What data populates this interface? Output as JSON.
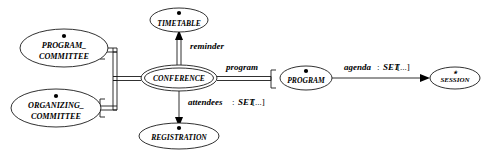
{
  "diagram": {
    "type": "entity-relationship",
    "background_color": "#ffffff",
    "line_color": "#1a1a1a",
    "text_color": "#000000",
    "nodes": [
      {
        "id": "program_committee",
        "label_line1": "PROGRAM_",
        "label_line2": "COMMITTEE",
        "marker": "filled-dot",
        "shape": "ellipse",
        "double_border": false,
        "cx": 64,
        "cy": 48,
        "rx": 44,
        "ry": 19
      },
      {
        "id": "organizing_committee",
        "label_line1": "ORGANIZING_",
        "label_line2": "COMMITTEE",
        "marker": "filled-dot",
        "shape": "ellipse",
        "double_border": false,
        "cx": 56,
        "cy": 108,
        "rx": 45,
        "ry": 19
      },
      {
        "id": "timetable",
        "label_line1": "TIMETABLE",
        "label_line2": "",
        "marker": "filled-dot",
        "shape": "ellipse",
        "double_border": false,
        "cx": 179,
        "cy": 20,
        "rx": 29,
        "ry": 12
      },
      {
        "id": "conference",
        "label_line1": "CONFERENCE",
        "label_line2": "",
        "marker": "none",
        "shape": "ellipse",
        "double_border": true,
        "cx": 179,
        "cy": 78,
        "rx": 38,
        "ry": 13
      },
      {
        "id": "registration",
        "label_line1": "REGISTRATION",
        "label_line2": "",
        "marker": "filled-dot",
        "shape": "ellipse",
        "double_border": false,
        "cx": 179,
        "cy": 136,
        "rx": 40,
        "ry": 13
      },
      {
        "id": "program",
        "label_line1": "PROGRAM",
        "label_line2": "",
        "marker": "filled-dot",
        "shape": "ellipse",
        "double_border": false,
        "cx": 306,
        "cy": 78,
        "rx": 26,
        "ry": 12
      },
      {
        "id": "session",
        "label_line1": "SESSION",
        "label_line2": "",
        "marker": "small-star",
        "shape": "ellipse",
        "double_border": false,
        "cx": 455,
        "cy": 78,
        "rx": 25,
        "ry": 11
      }
    ],
    "edges": [
      {
        "id": "reminder",
        "from": "conference",
        "to": "timetable",
        "attribute": "reminder",
        "type": "",
        "aggregation": "",
        "label": "reminder",
        "arrow": "up",
        "style": "double-line"
      },
      {
        "id": "attendees",
        "from": "conference",
        "to": "registration",
        "attribute": "attendees",
        "type": "SET",
        "aggregation": "[...]",
        "label": "attendees : SET [...]",
        "arrow": "down",
        "style": "single-line"
      },
      {
        "id": "program",
        "from": "conference",
        "to": "program",
        "attribute": "program",
        "type": "",
        "aggregation": "",
        "label": "program",
        "arrow": "none",
        "style": "double-line"
      },
      {
        "id": "agenda",
        "from": "program",
        "to": "session",
        "attribute": "agenda",
        "type": "SET",
        "aggregation": "[...]",
        "label": "agenda : SET [...]",
        "arrow": "right",
        "style": "single-line"
      },
      {
        "id": "supertype_subtype",
        "from": "conference",
        "to": "program_committee, organizing_committee",
        "attribute": "",
        "type": "",
        "aggregation": "",
        "label": "",
        "arrow": "none",
        "style": "double-line-tree"
      }
    ],
    "labels": {
      "reminder": "reminder",
      "attendees_name": "attendees",
      "attendees_colon": " : ",
      "attendees_type": "SET",
      "attendees_agg": " [...]",
      "program": "program",
      "agenda_name": "agenda",
      "agenda_colon": " : ",
      "agenda_type": "SET",
      "agenda_agg": " [...]"
    }
  }
}
